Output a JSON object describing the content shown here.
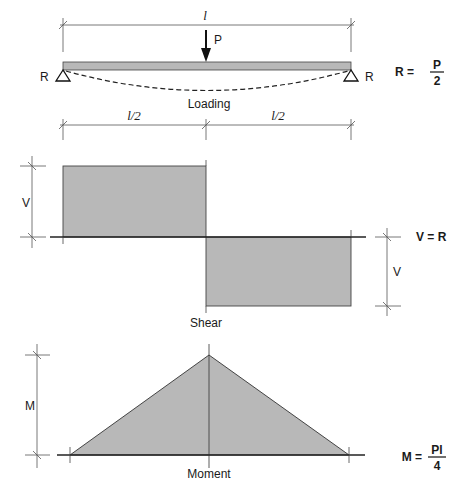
{
  "diagram": {
    "colors": {
      "fill": "#b8b8b8",
      "line": "#2a2a2a",
      "dim_line": "#555555"
    },
    "loading": {
      "span_label": "l",
      "load_label": "P",
      "left_reaction": "R",
      "right_reaction": "R",
      "caption": "Loading",
      "half_span_left": "l/2",
      "half_span_right": "l/2",
      "equation": {
        "lhs": "R =",
        "num": "P",
        "den": "2"
      }
    },
    "shear": {
      "caption": "Shear",
      "left_dim_label": "V",
      "right_dim_label": "V",
      "equation": {
        "lhs": "V = R"
      }
    },
    "moment": {
      "caption": "Moment",
      "dim_label": "M",
      "equation": {
        "lhs": "M =",
        "num": "Pl",
        "den": "4"
      }
    }
  }
}
